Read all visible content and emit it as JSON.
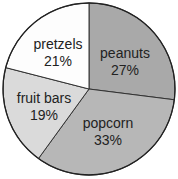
{
  "chart_data": {
    "type": "pie",
    "title": "",
    "categories": [
      "peanuts",
      "popcorn",
      "fruit bars",
      "pretzels"
    ],
    "values": [
      27,
      33,
      19,
      21
    ],
    "unit": "%",
    "colors": [
      "#a9a9a9",
      "#b7b7b7",
      "#dadada",
      "#fdfdfd"
    ],
    "labels": [
      {
        "name": "peanuts",
        "pct": "27%"
      },
      {
        "name": "popcorn",
        "pct": "33%"
      },
      {
        "name": "fruit bars",
        "pct": "19%"
      },
      {
        "name": "pretzels",
        "pct": "21%"
      }
    ],
    "start_angle_deg": 0,
    "direction": "clockwise",
    "legend": "none"
  }
}
